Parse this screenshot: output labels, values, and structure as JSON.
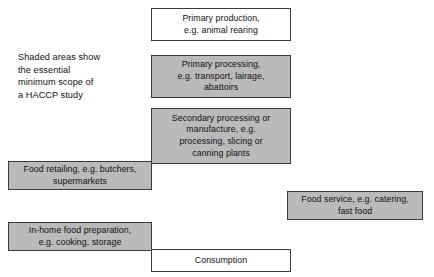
{
  "diagram": {
    "caption": {
      "text": "Shaded areas show\nthe essential\nminimum scope of\na HACCP study"
    },
    "colors": {
      "shaded_fill": "#bababa",
      "plain_fill": "#ffffff",
      "border": "#3a3a3a",
      "text": "#111111"
    },
    "boxes": [
      {
        "id": "primary-production",
        "label": "Primary production,\ne.g. animal rearing",
        "shaded": false
      },
      {
        "id": "primary-processing",
        "label": "Primary processing,\ne.g. transport, lairage,\nabattoirs",
        "shaded": true
      },
      {
        "id": "secondary-processing",
        "label": "Secondary processing or\nmanufacture, e.g.\nprocessing, slicing or\ncanning plants",
        "shaded": true
      },
      {
        "id": "food-retailing",
        "label": "Food retailing, e.g. butchers,\nsupermarkets",
        "shaded": true
      },
      {
        "id": "food-service",
        "label": "Food service, e.g. catering,\nfast food",
        "shaded": true
      },
      {
        "id": "inhome-preparation",
        "label": "In-home food preparation,\ne.g. cooking, storage",
        "shaded": true
      },
      {
        "id": "consumption",
        "label": "Consumption",
        "shaded": false
      }
    ]
  }
}
